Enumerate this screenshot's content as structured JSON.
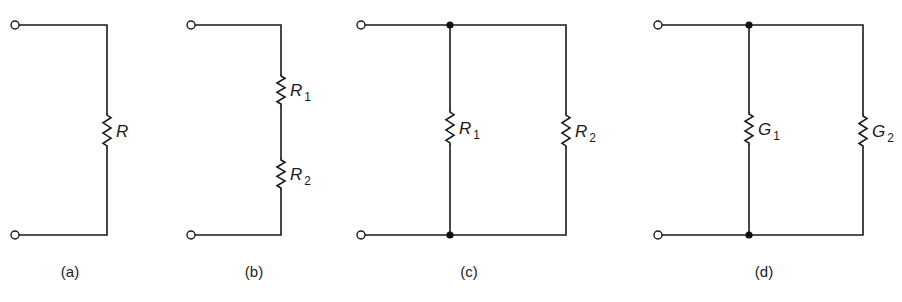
{
  "figure": {
    "colors": {
      "ink": "#1a1a1a",
      "background": "#ffffff"
    },
    "panels": [
      {
        "id": "a",
        "caption": "(a)",
        "caption_pos": [
          70,
          277
        ],
        "topology": "single",
        "terminals": [
          [
            15,
            25
          ],
          [
            15,
            235
          ]
        ],
        "top_wire": [
          [
            19,
            25
          ],
          [
            107,
            25
          ],
          [
            107,
            113
          ]
        ],
        "bottom_wire": [
          [
            19,
            235
          ],
          [
            107,
            235
          ],
          [
            107,
            148
          ]
        ],
        "junctions": [],
        "branches": [],
        "resistors": [
          {
            "x": 107,
            "y1": 113,
            "y2": 148,
            "symbol": "R",
            "subscript": ""
          }
        ]
      },
      {
        "id": "b",
        "caption": "(b)",
        "caption_pos": [
          254,
          277
        ],
        "topology": "series",
        "terminals": [
          [
            191,
            25
          ],
          [
            191,
            235
          ]
        ],
        "top_wire": [
          [
            195,
            25
          ],
          [
            281,
            25
          ],
          [
            281,
            74
          ]
        ],
        "bottom_wire": [
          [
            195,
            235
          ],
          [
            281,
            235
          ],
          [
            281,
            190
          ]
        ],
        "mid_wire": [
          [
            281,
            106
          ],
          [
            281,
            158
          ]
        ],
        "junctions": [],
        "branches": [],
        "resistors": [
          {
            "x": 281,
            "y1": 74,
            "y2": 106,
            "symbol": "R",
            "subscript": "1"
          },
          {
            "x": 281,
            "y1": 158,
            "y2": 190,
            "symbol": "R",
            "subscript": "2"
          }
        ]
      },
      {
        "id": "c",
        "caption": "(c)",
        "caption_pos": [
          469,
          277
        ],
        "topology": "parallel",
        "terminals": [
          [
            361,
            25
          ],
          [
            361,
            235
          ]
        ],
        "top_wire": [
          [
            365,
            25
          ],
          [
            566,
            25
          ],
          [
            566,
            113
          ]
        ],
        "bottom_wire": [
          [
            365,
            235
          ],
          [
            566,
            235
          ],
          [
            566,
            148
          ]
        ],
        "junctions": [
          [
            450,
            25
          ],
          [
            450,
            235
          ]
        ],
        "branches": [
          {
            "x": 450,
            "top": 25,
            "bottom": 235,
            "r_y1": 110,
            "r_y2": 145
          }
        ],
        "resistors": [
          {
            "x": 450,
            "y1": 110,
            "y2": 145,
            "symbol": "R",
            "subscript": "1"
          },
          {
            "x": 566,
            "y1": 113,
            "y2": 148,
            "symbol": "R",
            "subscript": "2"
          }
        ]
      },
      {
        "id": "d",
        "caption": "(d)",
        "caption_pos": [
          764,
          277
        ],
        "topology": "parallel",
        "terminals": [
          [
            658,
            25
          ],
          [
            658,
            235
          ]
        ],
        "top_wire": [
          [
            662,
            25
          ],
          [
            863,
            25
          ],
          [
            863,
            114
          ]
        ],
        "bottom_wire": [
          [
            662,
            235
          ],
          [
            863,
            235
          ],
          [
            863,
            148
          ]
        ],
        "junctions": [
          [
            749,
            25
          ],
          [
            749,
            235
          ]
        ],
        "branches": [
          {
            "x": 749,
            "top": 25,
            "bottom": 235,
            "r_y1": 112,
            "r_y2": 145
          }
        ],
        "resistors": [
          {
            "x": 749,
            "y1": 112,
            "y2": 145,
            "symbol": "G",
            "subscript": "1"
          },
          {
            "x": 863,
            "y1": 114,
            "y2": 148,
            "symbol": "G",
            "subscript": "2"
          }
        ]
      }
    ]
  }
}
